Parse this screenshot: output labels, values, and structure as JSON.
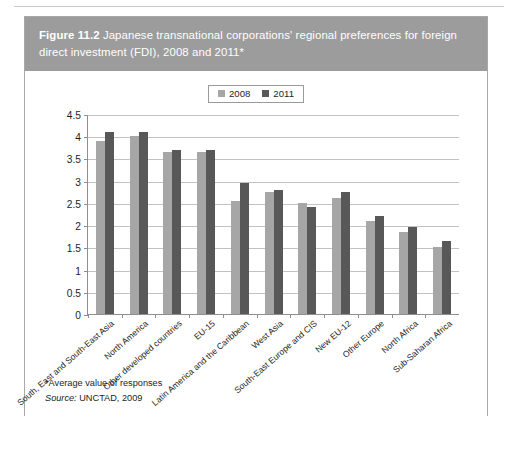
{
  "figure": {
    "label": "Figure 11.2",
    "caption": "Japanese transnational corporations' regional preferences for foreign direct investment (FDI), 2008 and 2011*",
    "footnote": "*Average value of responses",
    "source_prefix": "Source:",
    "source_text": " UNCTAD, 2009"
  },
  "colors": {
    "caption_bar": "#9c9c9c",
    "series_2008": "#a6a6a6",
    "series_2011": "#585858",
    "grid": "#c2c2c2",
    "axis": "#8e8e8e",
    "frame": "#a8a8a8"
  },
  "chart_data": {
    "type": "bar",
    "title": "Japanese transnational corporations' regional preferences for foreign direct investment (FDI), 2008 and 2011*",
    "xlabel": "",
    "ylabel": "",
    "ylim": [
      0,
      4.5
    ],
    "ytick_labels": [
      "4.5",
      "4",
      "3.5",
      "3",
      "2.5",
      "2",
      "1.5",
      "1",
      "0.5",
      "0"
    ],
    "yticks": [
      4.5,
      4,
      3.5,
      3,
      2.5,
      2,
      1.5,
      1,
      0.5,
      0
    ],
    "grid": true,
    "legend_position": "top-center",
    "categories": [
      "South, East and South-East Asia",
      "North America",
      "Other developed countries",
      "EU-15",
      "Latin America and the Caribbean",
      "West Asia",
      "South-East Europe and CIS",
      "New EU-12",
      "Other Europe",
      "North Africa",
      "Sub-Saharan Africa"
    ],
    "series": [
      {
        "name": "2008",
        "color": "#a6a6a6",
        "values": [
          3.9,
          4.0,
          3.65,
          3.65,
          2.55,
          2.75,
          2.5,
          2.6,
          2.1,
          1.85,
          1.5
        ]
      },
      {
        "name": "2011",
        "color": "#585858",
        "values": [
          4.1,
          4.1,
          3.7,
          3.7,
          2.95,
          2.78,
          2.4,
          2.75,
          2.2,
          1.95,
          1.65
        ]
      }
    ]
  }
}
